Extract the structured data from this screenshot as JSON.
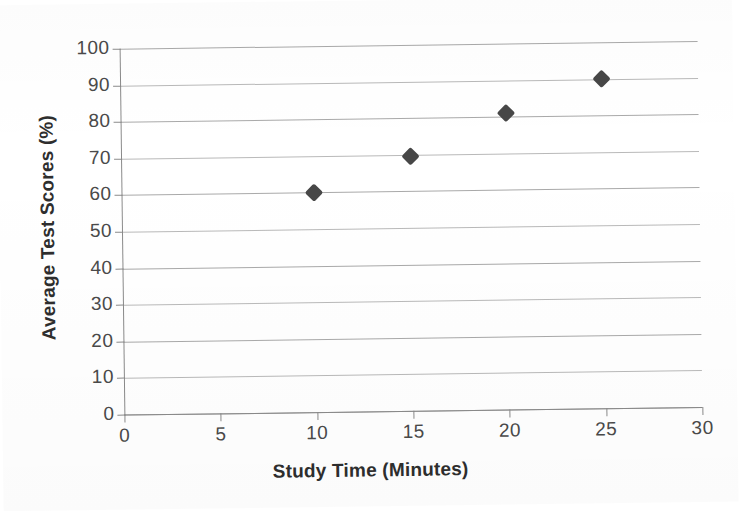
{
  "chart_data": {
    "type": "scatter",
    "title": "",
    "xlabel": "Study Time (Minutes)",
    "ylabel": "Average Test Scores (%)",
    "xlim": [
      0,
      30
    ],
    "ylim": [
      0,
      100
    ],
    "xticks": [
      "0",
      "5",
      "10",
      "15",
      "20",
      "25",
      "30"
    ],
    "yticks": [
      "0",
      "10",
      "20",
      "30",
      "40",
      "50",
      "60",
      "70",
      "80",
      "90",
      "100"
    ],
    "grid": "horizontal",
    "legend": "none",
    "marker": "diamond",
    "marker_color": "#474747",
    "gridline_color": "#a9a9a9",
    "axis_color": "#8a8a8a",
    "background_color": "#ffffff",
    "x": [
      10,
      15,
      20,
      25
    ],
    "y": [
      60,
      69.5,
      81,
      90
    ],
    "points": [
      {
        "x": 10,
        "y": 60
      },
      {
        "x": 15,
        "y": 69.5
      },
      {
        "x": 20,
        "y": 81
      },
      {
        "x": 25,
        "y": 90
      }
    ]
  }
}
